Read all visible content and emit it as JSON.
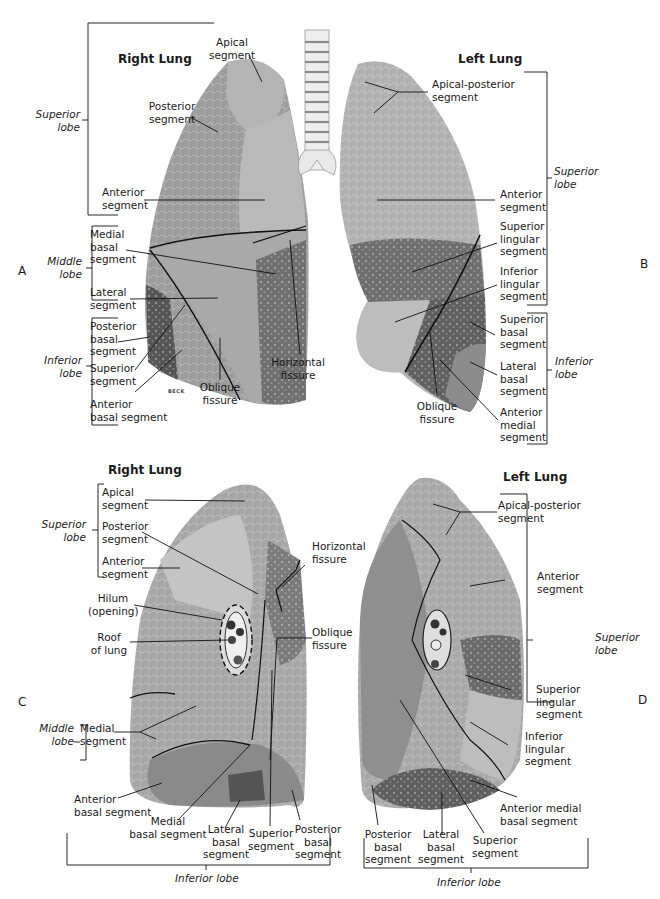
{
  "figure": {
    "panels": {
      "A": "A",
      "B": "B",
      "C": "C",
      "D": "D"
    },
    "artist_signature": "BECK",
    "panel_A": {
      "title": "Right Lung",
      "lobes": {
        "superior": "Superior\nlobe",
        "middle": "Middle\nlobe",
        "inferior": "Inferior\nlobe"
      },
      "labels": {
        "apical": "Apical\nsegment",
        "posterior": "Posterior\nsegment",
        "anterior": "Anterior\nsegment",
        "medial_basal": "Medial\nbasal\nsegment",
        "lateral": "Lateral\nsegment",
        "posterior_basal": "Posterior\nbasal\nsegment",
        "superior": "Superior\nsegment",
        "anterior_basal": "Anterior\nbasal segment",
        "oblique_fissure": "Oblique\nfissure",
        "horizontal_fissure": "Horizontal\nfissure"
      }
    },
    "panel_B": {
      "title": "Left Lung",
      "lobes": {
        "superior": "Superior\nlobe",
        "inferior": "Inferior\nlobe"
      },
      "labels": {
        "apical_posterior": "Apical-posterior\nsegment",
        "anterior": "Anterior\nsegment",
        "superior_lingular": "Superior\nlingular\nsegment",
        "inferior_lingular": "Inferior\nlingular\nsegment",
        "superior_basal": "Superior\nbasal\nsegment",
        "lateral_basal": "Lateral\nbasal\nsegment",
        "anterior_medial": "Anterior\nmedial\nsegment",
        "oblique_fissure": "Oblique\nfissure"
      }
    },
    "panel_C": {
      "title": "Right Lung",
      "lobes": {
        "superior": "Superior\nlobe",
        "middle": "Middle\nlobe",
        "inferior": "Inferior lobe"
      },
      "labels": {
        "apical": "Apical\nsegment",
        "posterior": "Posterior\nsegment",
        "anterior": "Anterior\nsegment",
        "hilum": "Hilum\n(opening)",
        "roof": "Roof\nof lung",
        "horizontal_fissure": "Horizontal\nfissure",
        "oblique_fissure": "Oblique\nfissure",
        "medial": "Medial\nsegment",
        "anterior_basal": "Anterior\nbasal segment",
        "medial_basal": "Medial\nbasal segment",
        "lateral_basal": "Lateral\nbasal\nsegment",
        "superior": "Superior\nsegment",
        "posterior_basal": "Posterior\nbasal\nsegment"
      }
    },
    "panel_D": {
      "title": "Left Lung",
      "lobes": {
        "superior": "Superior\nlobe",
        "inferior": "Inferior lobe"
      },
      "labels": {
        "apical_posterior": "Apical-posterior\nsegment",
        "anterior": "Anterior\nsegment",
        "superior_lingular": "Superior\nlingular\nsegment",
        "inferior_lingular": "Inferior\nlingular\nsegment",
        "anterior_medial_basal": "Anterior medial\nbasal segment",
        "posterior_basal": "Posterior\nbasal\nsegment",
        "lateral_basal": "Lateral\nbasal\nsegment",
        "superior": "Superior\nsegment"
      }
    }
  }
}
